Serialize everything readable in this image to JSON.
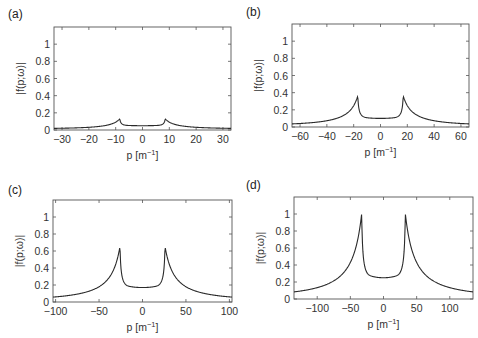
{
  "chart_data": [
    {
      "panel": "(a)",
      "type": "line",
      "title": "",
      "xlabel": "p [m^-1]",
      "ylabel": "|f(p;ω)|",
      "xlim": [
        -33,
        33
      ],
      "ylim": [
        0,
        1.2
      ],
      "xticks": [
        -30,
        -20,
        -10,
        0,
        10,
        20,
        30
      ],
      "yticks": [
        0,
        0.2,
        0.4,
        0.6,
        0.8,
        1
      ],
      "grid": false,
      "cusp_p": 8.5,
      "peak": 0.13,
      "center": 0.05,
      "edge": 0.01,
      "x": [
        -33,
        -25,
        -20,
        -15,
        -10,
        -8.5,
        -7,
        -4,
        0,
        4,
        7,
        8.5,
        10,
        15,
        20,
        25,
        33
      ],
      "y": [
        0.01,
        0.02,
        0.03,
        0.05,
        0.09,
        0.13,
        0.07,
        0.055,
        0.05,
        0.055,
        0.07,
        0.13,
        0.09,
        0.05,
        0.03,
        0.02,
        0.01
      ]
    },
    {
      "panel": "(b)",
      "type": "line",
      "title": "",
      "xlabel": "p [m^-1]",
      "ylabel": "|f(p;ω)|",
      "xlim": [
        -66,
        66
      ],
      "ylim": [
        0,
        1.2
      ],
      "xticks": [
        -60,
        -40,
        -20,
        0,
        20,
        40,
        60
      ],
      "yticks": [
        0,
        0.2,
        0.4,
        0.6,
        0.8,
        1
      ],
      "grid": false,
      "cusp_p": 17,
      "peak": 0.36,
      "center": 0.1,
      "edge": 0.01,
      "x": [
        -66,
        -50,
        -40,
        -30,
        -20,
        -17,
        -14,
        -8,
        0,
        8,
        14,
        17,
        20,
        30,
        40,
        50,
        66
      ],
      "y": [
        0.01,
        0.03,
        0.06,
        0.12,
        0.25,
        0.36,
        0.16,
        0.11,
        0.1,
        0.11,
        0.16,
        0.36,
        0.25,
        0.12,
        0.06,
        0.03,
        0.01
      ]
    },
    {
      "panel": "(c)",
      "type": "line",
      "title": "",
      "xlabel": "p [m^-1]",
      "ylabel": "|f(p;ω)|",
      "xlim": [
        -103,
        103
      ],
      "ylim": [
        0,
        1.2
      ],
      "xticks": [
        -100,
        -50,
        0,
        50,
        100
      ],
      "yticks": [
        0,
        0.2,
        0.4,
        0.6,
        0.8,
        1
      ],
      "grid": false,
      "cusp_p": 26,
      "peak": 0.65,
      "center": 0.17,
      "edge": 0.01,
      "x": [
        -103,
        -75,
        -50,
        -35,
        -26,
        -20,
        -10,
        0,
        10,
        20,
        26,
        35,
        50,
        75,
        103
      ],
      "y": [
        0.01,
        0.06,
        0.14,
        0.28,
        0.65,
        0.25,
        0.18,
        0.17,
        0.18,
        0.25,
        0.65,
        0.28,
        0.14,
        0.06,
        0.01
      ]
    },
    {
      "panel": "(d)",
      "type": "line",
      "title": "",
      "xlabel": "p [m^-1]",
      "ylabel": "|f(p;ω)|",
      "xlim": [
        -135,
        135
      ],
      "ylim": [
        0,
        1.2
      ],
      "xticks": [
        -100,
        -50,
        0,
        50,
        100
      ],
      "yticks": [
        0,
        0.2,
        0.4,
        0.6,
        0.8,
        1
      ],
      "grid": false,
      "cusp_p": 33,
      "peak": 1.0,
      "center": 0.25,
      "edge": 0.01,
      "x": [
        -135,
        -100,
        -75,
        -50,
        -33,
        -25,
        -15,
        0,
        15,
        25,
        33,
        50,
        75,
        100,
        135
      ],
      "y": [
        0.01,
        0.07,
        0.14,
        0.35,
        1.0,
        0.38,
        0.28,
        0.25,
        0.28,
        0.38,
        1.0,
        0.35,
        0.14,
        0.07,
        0.01
      ]
    }
  ],
  "layout": {
    "frames": [
      {
        "left": 54,
        "top": 27,
        "right": 231,
        "bottom": 130,
        "label_x": 8,
        "label_y": 18
      },
      {
        "left": 292,
        "top": 24,
        "right": 469,
        "bottom": 127,
        "label_x": 246,
        "label_y": 16
      },
      {
        "left": 53,
        "top": 200,
        "right": 232,
        "bottom": 302,
        "label_x": 8,
        "label_y": 194
      },
      {
        "left": 294,
        "top": 197,
        "right": 473,
        "bottom": 299,
        "label_x": 246,
        "label_y": 189
      }
    ],
    "line_color": "#2a2a2a",
    "frame_color": "#555555"
  }
}
